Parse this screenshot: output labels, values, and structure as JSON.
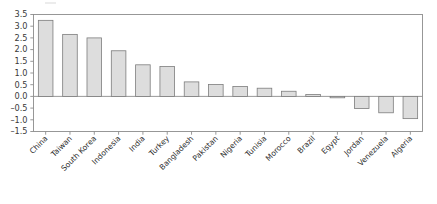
{
  "chart_data": {
    "type": "bar",
    "title": "",
    "subtitle": "",
    "xlabel": "",
    "ylabel": "",
    "ylim": [
      -1.5,
      3.5
    ],
    "ytick_step": 0.5,
    "grid": false,
    "legend": "none",
    "bar_fill_color": "#dddddd",
    "bar_edge_color": "#7d7d7d",
    "axis_color": "#8d8d8d",
    "categories": [
      "China",
      "Taiwan",
      "South Korea",
      "Indonesia",
      "India",
      "Turkey",
      "Bangladesh",
      "Pakistan",
      "Nigeria",
      "Tunisia",
      "Morocco",
      "Brazil",
      "Egypt",
      "Jordan",
      "Venezuela",
      "Algeria"
    ],
    "values": [
      3.25,
      2.65,
      2.5,
      1.95,
      1.35,
      1.28,
      0.62,
      0.51,
      0.42,
      0.35,
      0.22,
      0.08,
      -0.06,
      -0.52,
      -0.7,
      -0.95
    ],
    "ytick_labels": [
      "3.5",
      "3.0",
      "2.5",
      "2.0",
      "1.5",
      "1.0",
      "0.5",
      "0.0",
      "-0.5",
      "-1.0",
      "-1.5"
    ],
    "ytick_values": [
      3.5,
      3.0,
      2.5,
      2.0,
      1.5,
      1.0,
      0.5,
      0.0,
      -0.5,
      -1.0,
      -1.5
    ]
  }
}
